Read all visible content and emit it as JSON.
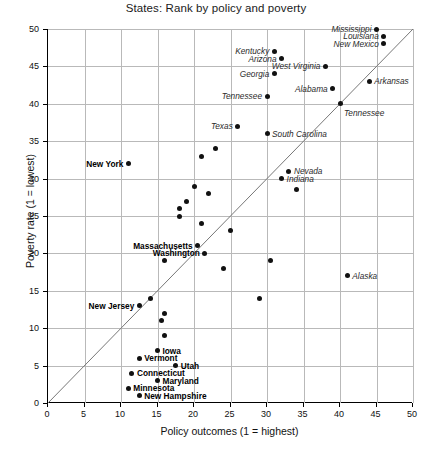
{
  "chart_data": {
    "type": "scatter",
    "title": "States: Rank by policy and poverty",
    "xlabel": "Policy outcomes (1 = highest)",
    "ylabel": "Poverty rate (1 = lowest)",
    "xlim": [
      0,
      50
    ],
    "ylim": [
      0,
      50
    ],
    "xticks": [
      0,
      5,
      10,
      15,
      20,
      25,
      30,
      35,
      40,
      45,
      50
    ],
    "yticks": [
      0,
      5,
      10,
      15,
      20,
      25,
      30,
      35,
      40,
      45,
      50
    ],
    "grid": true,
    "legend": "none",
    "annotations": [
      {
        "text": "diagonal reference line y = x",
        "from": [
          0,
          0
        ],
        "to": [
          50,
          50
        ]
      }
    ],
    "points": [
      {
        "label": "Mississippi",
        "x": 45,
        "y": 50,
        "label_style": "italic",
        "label_pos": "left"
      },
      {
        "label": "Louisiana",
        "x": 46,
        "y": 49,
        "label_style": "italic",
        "label_pos": "left"
      },
      {
        "label": "New Mexico",
        "x": 46,
        "y": 48,
        "label_style": "italic",
        "label_pos": "left"
      },
      {
        "label": "Kentucky",
        "x": 31,
        "y": 47,
        "label_style": "italic",
        "label_pos": "left"
      },
      {
        "label": "Arizona",
        "x": 32,
        "y": 46,
        "label_style": "italic",
        "label_pos": "left"
      },
      {
        "label": "West Virginia",
        "x": 38,
        "y": 45,
        "label_style": "italic",
        "label_pos": "left"
      },
      {
        "label": "Georgia",
        "x": 31,
        "y": 44,
        "label_style": "italic",
        "label_pos": "left"
      },
      {
        "label": "Arkansas",
        "x": 44,
        "y": 43,
        "label_style": "italic",
        "label_pos": "right"
      },
      {
        "label": "Alabama",
        "x": 39,
        "y": 42,
        "label_style": "italic",
        "label_pos": "left"
      },
      {
        "label": "Tennessee",
        "x": 30,
        "y": 41,
        "label_style": "italic",
        "label_pos": "left"
      },
      {
        "label": "Tennessee",
        "x": 40,
        "y": 40,
        "label_style": "italic",
        "label_pos": "below"
      },
      {
        "label": "Texas",
        "x": 26,
        "y": 37,
        "label_style": "italic",
        "label_pos": "left"
      },
      {
        "label": "South Carolina",
        "x": 30,
        "y": 36,
        "label_style": "italic",
        "label_pos": "right"
      },
      {
        "label": "",
        "x": 23,
        "y": 34
      },
      {
        "label": "",
        "x": 21,
        "y": 33
      },
      {
        "label": "New York",
        "x": 11,
        "y": 32,
        "label_style": "bold",
        "label_pos": "left"
      },
      {
        "label": "Nevada",
        "x": 33,
        "y": 31,
        "label_style": "italic",
        "label_pos": "right"
      },
      {
        "label": "Indiana",
        "x": 32,
        "y": 30,
        "label_style": "italic",
        "label_pos": "right"
      },
      {
        "label": "",
        "x": 20,
        "y": 29
      },
      {
        "label": "",
        "x": 34,
        "y": 28.5
      },
      {
        "label": "",
        "x": 22,
        "y": 28
      },
      {
        "label": "",
        "x": 19,
        "y": 27
      },
      {
        "label": "",
        "x": 18,
        "y": 26
      },
      {
        "label": "",
        "x": 18,
        "y": 25
      },
      {
        "label": "",
        "x": 21,
        "y": 24
      },
      {
        "label": "",
        "x": 25,
        "y": 23
      },
      {
        "label": "Massachusetts",
        "x": 20.5,
        "y": 21,
        "label_style": "bold",
        "label_pos": "left"
      },
      {
        "label": "Washington",
        "x": 21.5,
        "y": 20,
        "label_style": "bold",
        "label_pos": "left"
      },
      {
        "label": "",
        "x": 30.5,
        "y": 19
      },
      {
        "label": "",
        "x": 16,
        "y": 19
      },
      {
        "label": "",
        "x": 24,
        "y": 18
      },
      {
        "label": "Alaska",
        "x": 41,
        "y": 17,
        "label_style": "italic",
        "label_pos": "right"
      },
      {
        "label": "",
        "x": 29,
        "y": 14
      },
      {
        "label": "",
        "x": 14,
        "y": 14
      },
      {
        "label": "New Jersey",
        "x": 12.5,
        "y": 13,
        "label_style": "bold",
        "label_pos": "left"
      },
      {
        "label": "",
        "x": 16,
        "y": 12
      },
      {
        "label": "",
        "x": 15.5,
        "y": 11
      },
      {
        "label": "",
        "x": 16,
        "y": 9
      },
      {
        "label": "Iowa",
        "x": 15,
        "y": 7,
        "label_style": "bold",
        "label_pos": "right"
      },
      {
        "label": "Vermont",
        "x": 12.5,
        "y": 6,
        "label_style": "bold",
        "label_pos": "right"
      },
      {
        "label": "Utah",
        "x": 17.5,
        "y": 5,
        "label_style": "bold",
        "label_pos": "right"
      },
      {
        "label": "Connecticut",
        "x": 11.5,
        "y": 4,
        "label_style": "bold",
        "label_pos": "right"
      },
      {
        "label": "Maryland",
        "x": 15,
        "y": 3,
        "label_style": "bold",
        "label_pos": "right"
      },
      {
        "label": "Minnesota",
        "x": 11,
        "y": 2,
        "label_style": "bold",
        "label_pos": "right"
      },
      {
        "label": "New Hampshire",
        "x": 12.5,
        "y": 1,
        "label_style": "bold",
        "label_pos": "right"
      }
    ],
    "colors": {
      "point": "#111111",
      "grid": "#b9b9b9",
      "axis": "#000000",
      "diagonal": "#777777",
      "background": "#ffffff"
    }
  }
}
